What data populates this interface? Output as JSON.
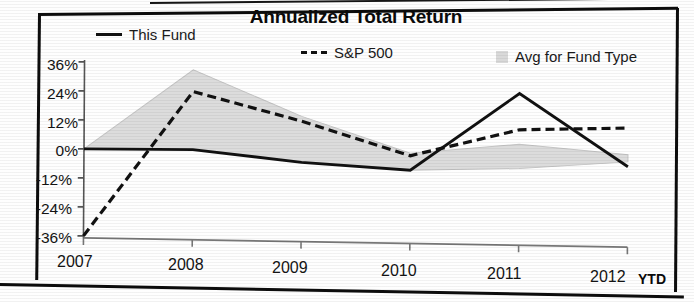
{
  "chart_data": {
    "type": "line",
    "title": "Annualized Total Return",
    "xlabel": "",
    "ylabel": "",
    "x": [
      "2007",
      "2008",
      "2009",
      "2010",
      "2011",
      "2012 YTD"
    ],
    "categories": [
      "2007",
      "2008",
      "2009",
      "2010",
      "2011",
      "2012"
    ],
    "ylim": [
      -36,
      36
    ],
    "yticks": [
      36,
      24,
      12,
      0,
      -12,
      -24,
      -36
    ],
    "ytick_labels": [
      "36%",
      "24%",
      "12%",
      "0%",
      "-12%",
      "-24%",
      "-36%"
    ],
    "xtick_labels": [
      "2007",
      "2008",
      "2009",
      "2010",
      "2011",
      "2012"
    ],
    "grid": false,
    "legend_position": "top",
    "series": [
      {
        "name": "This Fund",
        "style": "solid",
        "color": "#111111",
        "values": [
          0,
          0,
          -5,
          -8,
          24,
          -6
        ]
      },
      {
        "name": "S&P 500",
        "style": "dashed",
        "color": "#111111",
        "values": [
          -36,
          24,
          12,
          -2,
          9,
          10
        ]
      },
      {
        "name": "Avg for Fund Type",
        "style": "area",
        "color": "#d9d9d9",
        "values_upper": [
          0,
          33,
          14,
          -1,
          3,
          -1
        ],
        "values_lower": [
          0,
          0,
          -5,
          -8,
          -7,
          -4
        ]
      }
    ],
    "annotations": [
      "YTD"
    ]
  },
  "chart": {
    "title": "Annualized Total Return",
    "ytd_note": "YTD",
    "legend": [
      {
        "label": "This Fund",
        "swatch": "solid-line-swatch"
      },
      {
        "label": "S&P 500",
        "swatch": "dashed-line-swatch"
      },
      {
        "label": "Avg for Fund Type",
        "swatch": "gray-area-swatch"
      }
    ],
    "y_axis": {
      "t0": "36%",
      "t1": "24%",
      "t2": "12%",
      "t3": "0%",
      "t4": "-12%",
      "t5": "-24%",
      "t6": "-36%"
    },
    "x_axis": {
      "t0": "2007",
      "t1": "2008",
      "t2": "2009",
      "t3": "2010",
      "t4": "2011",
      "t5": "2012"
    }
  }
}
